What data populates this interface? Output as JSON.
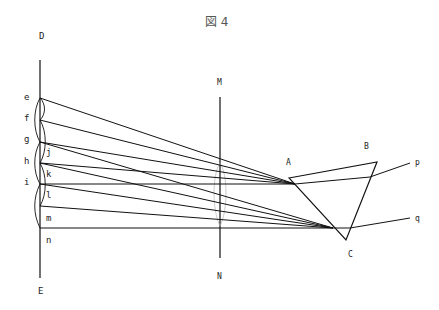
{
  "figure": {
    "caption": "図 4",
    "line_color": "#111111",
    "faint_color": "#999999"
  },
  "labels": {
    "D": "D",
    "E": "E",
    "M": "M",
    "N": "N",
    "A": "A",
    "B": "B",
    "C": "C",
    "P": "p",
    "Q": "q",
    "e": "e",
    "f": "f",
    "g": "g",
    "h": "h",
    "i": "i",
    "j": "j",
    "k": "k",
    "l": "l",
    "m": "m",
    "n": "n"
  }
}
